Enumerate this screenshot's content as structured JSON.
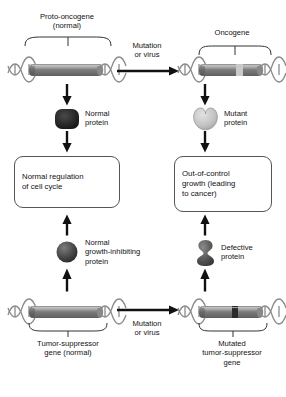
{
  "diagram": {
    "colors": {
      "dna_strand": "#8a8a8a",
      "gene_body_dark": "#6e6e6e",
      "gene_body_light": "#a8a8a8",
      "gene_band_light": "#c9c9c9",
      "gene_band_dark": "#2b2b2b",
      "normal_protein": "#262626",
      "mutant_protein": "#c4c4c4",
      "inhibiting_protein": "#4a4a4a",
      "defective_protein": "#555555",
      "arrow": "#111111",
      "box_border": "#555555",
      "text": "#111111",
      "background": "#ffffff"
    }
  },
  "left_column": {
    "gene_label": "Proto-oncogene\n(normal)",
    "gene_label_line1": "Proto-oncogene",
    "gene_label_line2": "(normal)",
    "gene_name": "proto-oncogene",
    "protein_label_line1": "Normal",
    "protein_label_line2": "protein",
    "outcome_line1": "Normal regulation",
    "outcome_line2": "of cell cycle",
    "inhibitor_label_line1": "Normal",
    "inhibitor_label_line2": "growth-inhibiting",
    "inhibitor_label_line3": "protein",
    "bottom_gene_label_line1": "Tumor-suppressor",
    "bottom_gene_label_line2": "gene (normal)"
  },
  "right_column": {
    "gene_label": "Oncogene",
    "protein_label_line1": "Mutant",
    "protein_label_line2": "protein",
    "outcome_line1": "Out-of-control",
    "outcome_line2": "growth (leading",
    "outcome_line3": "to cancer)",
    "defective_label_line1": "Defective",
    "defective_label_line2": "protein",
    "bottom_gene_label_line1": "Mutated",
    "bottom_gene_label_line2": "tumor-suppressor",
    "bottom_gene_label_line3": "gene"
  },
  "transitions": {
    "top_line1": "Mutation",
    "top_line2": "or virus",
    "bottom_line1": "Mutation",
    "bottom_line2": "or virus"
  }
}
